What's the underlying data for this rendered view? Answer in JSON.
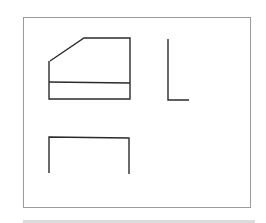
{
  "diagram": {
    "type": "orthographic-projection",
    "colors": {
      "background": "#ffffff",
      "frame": "#9a9a9a",
      "stroke": "#2b2b2b",
      "strip": "#dcdcdc"
    },
    "frame": {
      "x1": 23,
      "y1": 17,
      "x2": 250,
      "y2": 207
    },
    "views": [
      {
        "name": "front-view",
        "polyline": [
          [
            50,
            61
          ],
          [
            84,
            38
          ],
          [
            130,
            38
          ],
          [
            130,
            99
          ],
          [
            49,
            99
          ],
          [
            49,
            61
          ]
        ],
        "inner_line": [
          [
            49,
            82
          ],
          [
            130,
            83
          ]
        ]
      },
      {
        "name": "side-view",
        "polyline": [
          [
            168,
            39
          ],
          [
            168,
            100
          ],
          [
            189,
            100
          ]
        ]
      },
      {
        "name": "top-view",
        "polyline": [
          [
            49,
            173
          ],
          [
            49,
            137
          ],
          [
            129,
            138
          ],
          [
            129,
            174
          ]
        ]
      }
    ]
  }
}
